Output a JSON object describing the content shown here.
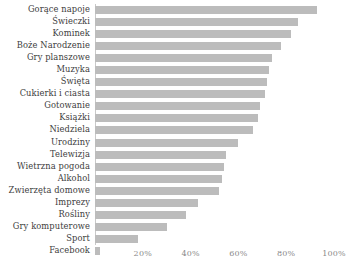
{
  "chart_data": {
    "type": "bar",
    "orientation": "horizontal",
    "title": "",
    "subtitle": "",
    "xlabel": "",
    "ylabel": "",
    "xlim": [
      0,
      100
    ],
    "grid": false,
    "legend": null,
    "bar_color": "#bcbcbc",
    "axis_color": "#c9c9c9",
    "tick_label_color": "#8a8a8a",
    "category_label_color": "#3d3d3d",
    "xticks": [
      "20%",
      "40%",
      "60%",
      "80%",
      "100%"
    ],
    "xtick_values": [
      20,
      40,
      60,
      80,
      100
    ],
    "categories": [
      "Gorące napoje",
      "Świeczki",
      "Kominek",
      "Boże Narodzenie",
      "Gry planszowe",
      "Muzyka",
      "Święta",
      "Cukierki i ciasta",
      "Gotowanie",
      "Książki",
      "Niedziela",
      "Urodziny",
      "Telewizja",
      "Wietrzna pogoda",
      "Alkohol",
      "Zwierzęta domowe",
      "Imprezy",
      "Rośliny",
      "Gry komputerowe",
      "Sport",
      "Facebook"
    ],
    "values": [
      93,
      85,
      82,
      78,
      74,
      73,
      72,
      71,
      69,
      68,
      66,
      60,
      55,
      54,
      53,
      52,
      43,
      38,
      30,
      18,
      2
    ]
  }
}
